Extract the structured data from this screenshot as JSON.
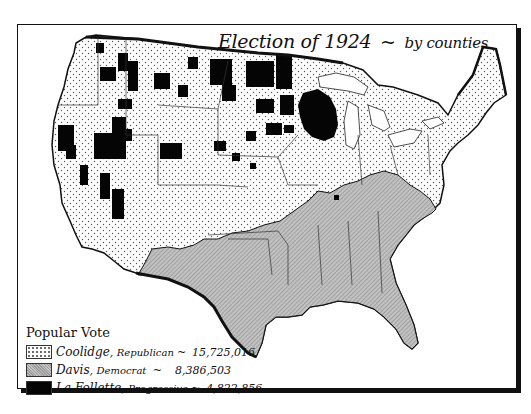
{
  "title": {
    "main": "Election of 1924",
    "separator": "~",
    "subtitle": "by counties"
  },
  "legend": {
    "title": "Popular Vote",
    "items": [
      {
        "candidate": "Coolidge",
        "party": "Republican",
        "votes": "15,725,016",
        "pattern": "dotted",
        "color": "#ffffff"
      },
      {
        "candidate": "Davis",
        "party": "Democrat",
        "votes": "8,386,503",
        "pattern": "hatched-gray",
        "color": "#b0b0b0"
      },
      {
        "candidate": "La Follette",
        "party": "Progressive",
        "votes": "4,822,856",
        "pattern": "solid-black",
        "color": "#050505"
      }
    ]
  },
  "map": {
    "regions": [
      {
        "name": "West / Plains / North / Northeast",
        "winner": "Coolidge"
      },
      {
        "name": "South",
        "winner": "Davis"
      },
      {
        "name": "Wisconsin",
        "winner": "La Follette"
      },
      {
        "name": "Scattered counties in North Dakota, Minnesota, Montana, Idaho, Washington, Nevada, California, Wyoming, Iowa",
        "winner": "La Follette"
      }
    ]
  }
}
